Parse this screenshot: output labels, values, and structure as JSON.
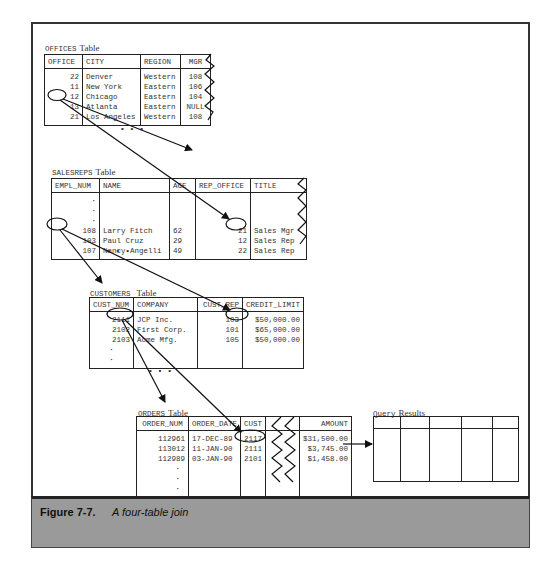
{
  "figure": {
    "label": "Figure 7-7.",
    "caption": "A four-table join"
  },
  "offices": {
    "name": "OFFICES",
    "word": "Table",
    "columns": [
      "OFFICE",
      "CITY",
      "REGION",
      "MGR"
    ],
    "rows": [
      [
        "22",
        "Denver",
        "Western",
        "108"
      ],
      [
        "11",
        "New York",
        "Eastern",
        "106"
      ],
      [
        "12",
        "Chicago",
        "Eastern",
        "104"
      ],
      [
        "13",
        "Atlanta",
        "Eastern",
        "NULL"
      ],
      [
        "21",
        "Los Angeles",
        "Western",
        "108"
      ]
    ],
    "ellipsis": "• • •"
  },
  "salesreps": {
    "name": "SALESREPS",
    "word": "Table",
    "columns": [
      "EMPL_NUM",
      "NAME",
      "AGE",
      "REP_OFFICE",
      "TITLE"
    ],
    "rows": [
      [
        ":",
        "",
        "",
        "",
        ""
      ],
      [
        "108",
        "Larry Fitch",
        "62",
        "21",
        "Sales Mgr"
      ],
      [
        "103",
        "Paul Cruz",
        "29",
        "12",
        "Sales Rep"
      ],
      [
        "107",
        "Nancy Angelli",
        "49",
        "22",
        "Sales Rep"
      ]
    ],
    "ellipsis": "• • •"
  },
  "customers": {
    "name": "CUSTOMERS",
    "word": "Table",
    "columns": [
      "CUST_NUM",
      "COMPANY",
      "CUST_REP",
      "CREDIT_LIMIT"
    ],
    "rows": [
      [
        "2111",
        "JCP Inc.",
        "103",
        "$50,000.00"
      ],
      [
        "2102",
        "First Corp.",
        "101",
        "$65,000.00"
      ],
      [
        "2103",
        "Acme Mfg.",
        "105",
        "$50,000.00"
      ],
      [
        ":",
        "",
        "",
        ""
      ]
    ],
    "ellipsis": "• • •"
  },
  "orders": {
    "name": "ORDERS",
    "word": "Table",
    "columns": [
      "ORDER_NUM",
      "ORDER_DATE",
      "CUST",
      "",
      "AMOUNT"
    ],
    "rows": [
      [
        "112961",
        "17-DEC-89",
        "2117",
        "",
        "$31,500.00"
      ],
      [
        "113012",
        "11-JAN-90",
        "2111",
        "",
        "$3,745.00"
      ],
      [
        "112989",
        "03-JAN-90",
        "2101",
        "",
        "$1,458.00"
      ],
      [
        ":",
        "",
        "",
        "",
        ""
      ]
    ]
  },
  "query_results": {
    "name": "Query",
    "word": "Results",
    "column_count": 5
  }
}
